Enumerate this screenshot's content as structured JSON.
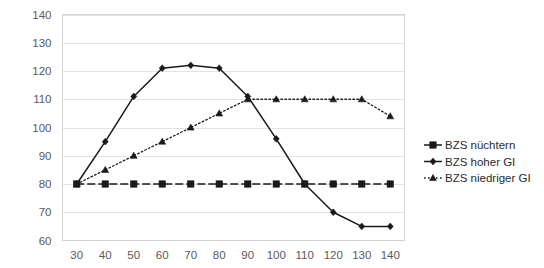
{
  "chart_data": {
    "type": "line",
    "title": "",
    "xlabel": "",
    "ylabel": "",
    "x": [
      30,
      40,
      50,
      60,
      70,
      80,
      90,
      100,
      110,
      120,
      130,
      140
    ],
    "xlim": [
      25,
      145
    ],
    "ylim": [
      60,
      140
    ],
    "ytick_values": [
      60,
      70,
      80,
      90,
      100,
      110,
      120,
      130,
      140
    ],
    "xtick_labels": [
      "30",
      "40",
      "50",
      "60",
      "70",
      "80",
      "90",
      "100",
      "110",
      "120",
      "130",
      "140"
    ],
    "ytick_labels": [
      "60",
      "70",
      "80",
      "90",
      "100",
      "110",
      "120",
      "130",
      "140"
    ],
    "grid": true,
    "legend_position": "right",
    "series": [
      {
        "name": "BZS nüchtern",
        "marker": "square",
        "line_style": "dashed",
        "color": "#1a1a1a",
        "values": [
          80,
          80,
          80,
          80,
          80,
          80,
          80,
          80,
          80,
          80,
          80,
          80
        ]
      },
      {
        "name": "BZS hoher GI",
        "marker": "diamond",
        "line_style": "solid",
        "color": "#1a1a1a",
        "values": [
          80,
          95,
          111,
          121,
          122,
          121,
          111,
          96,
          80,
          70,
          65,
          65
        ]
      },
      {
        "name": "BZS niedriger GI",
        "marker": "triangle",
        "line_style": "dotted",
        "color": "#1a1a1a",
        "values": [
          80,
          85,
          90,
          95,
          100,
          105,
          110,
          110,
          110,
          110,
          110,
          104
        ]
      }
    ]
  },
  "legend": {
    "entries": [
      {
        "label": "BZS nüchtern"
      },
      {
        "label": "BZS hoher GI"
      },
      {
        "label": "BZS niedriger GI"
      }
    ]
  }
}
